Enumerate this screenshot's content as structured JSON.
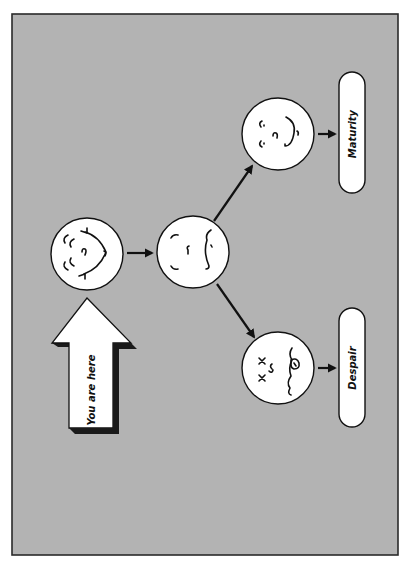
{
  "diagram": {
    "orientation": "rotated-90-ccw",
    "colors": {
      "background": "#b3b3b3",
      "frame_border": "#2a2a2a",
      "face_fill": "#ffffff",
      "stroke": "#111111",
      "arrow_fill": "#ffffff",
      "arrow_shadow": "#1a1a1a"
    },
    "you_are_here": {
      "label": "You are here",
      "icon": "up-arrow-icon"
    },
    "nodes": [
      {
        "id": "start",
        "icon": "grinning-face-icon",
        "expression": "happy"
      },
      {
        "id": "middle",
        "icon": "neutral-face-icon",
        "expression": "uncertain"
      },
      {
        "id": "maturity",
        "icon": "content-face-icon",
        "expression": "content"
      },
      {
        "id": "despair",
        "icon": "dead-face-icon",
        "expression": "dead, tongue out"
      }
    ],
    "outcomes": [
      {
        "id": "maturity",
        "label": "Maturity"
      },
      {
        "id": "despair",
        "label": "Despair"
      }
    ],
    "edges": [
      {
        "from": "start",
        "to": "middle"
      },
      {
        "from": "middle",
        "to": "maturity"
      },
      {
        "from": "middle",
        "to": "despair"
      },
      {
        "from": "maturity",
        "to": "maturity-label"
      },
      {
        "from": "despair",
        "to": "despair-label"
      }
    ]
  }
}
